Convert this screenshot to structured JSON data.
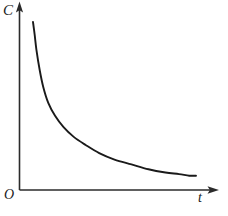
{
  "figure": {
    "kind": "line-chart",
    "background_color": "#ffffff",
    "stroke_color": "#1a1a1a",
    "axis_color": "#2b2b2b"
  },
  "labels": {
    "y_axis": "C",
    "x_axis": "t",
    "origin": "O"
  },
  "icons": {
    "y_axis_arrow": "arrow-up-icon",
    "x_axis_arrow": "arrow-right-icon"
  },
  "chart_data": {
    "type": "line",
    "title": "",
    "subtitle": "",
    "xlabel": "t",
    "ylabel": "C",
    "origin_label": "O",
    "grid": false,
    "legend": null,
    "axis_arrows": {
      "x": true,
      "y": true
    },
    "tick_labels": {
      "x": [],
      "y": []
    },
    "xlim": [
      0,
      1
    ],
    "ylim": [
      0,
      1
    ],
    "series": [
      {
        "name": "concentration-decay",
        "description": "monotonic decreasing convex exponential decay curve",
        "color": "#1a1a1a",
        "x": [
          0.04,
          0.05,
          0.06,
          0.08,
          0.1,
          0.13,
          0.17,
          0.22,
          0.28,
          0.35,
          0.43,
          0.52,
          0.62,
          0.72,
          0.82,
          0.9,
          0.96,
          1.0
        ],
        "y": [
          1.0,
          0.92,
          0.83,
          0.7,
          0.6,
          0.5,
          0.42,
          0.35,
          0.29,
          0.24,
          0.19,
          0.15,
          0.12,
          0.09,
          0.07,
          0.06,
          0.05,
          0.05
        ]
      }
    ]
  }
}
